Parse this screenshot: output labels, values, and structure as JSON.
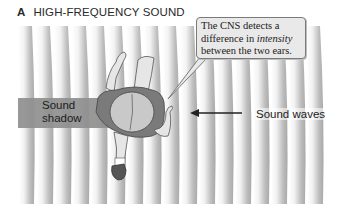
{
  "panel": {
    "letter": "A",
    "title": "HIGH-FREQUENCY SOUND"
  },
  "callout": {
    "line1": "The CNS detects a",
    "line2_prefix": "difference in ",
    "line2_emphasis": "intensity",
    "line3": "between the two ears."
  },
  "labels": {
    "sound_shadow_line1": "Sound",
    "sound_shadow_line2": "shadow",
    "sound_waves": "Sound waves"
  },
  "colors": {
    "shadow_fill": "#8f8f8f",
    "callout_fill": "#e9e9e9",
    "shirt": "#7a7a7a",
    "skin": "#e6e6e6"
  },
  "diagram": {
    "wave_direction": "right-to-left",
    "wave_stripe_count": 17
  }
}
